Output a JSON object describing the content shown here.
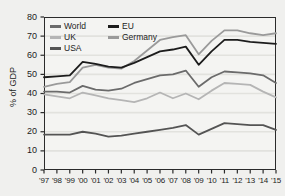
{
  "chart_data": {
    "type": "line",
    "title": "",
    "subtitle": "",
    "xlabel": "",
    "ylabel": "% of GDP",
    "ylim": [
      0,
      80
    ],
    "yticks": [
      0,
      10,
      20,
      30,
      40,
      50,
      60,
      70,
      80
    ],
    "grid": true,
    "grid_axis": "y",
    "legend_position": "top-left-inside",
    "x": [
      1997,
      1998,
      1999,
      2000,
      2001,
      2002,
      2003,
      2004,
      2005,
      2006,
      2007,
      2008,
      2009,
      2010,
      2011,
      2012,
      2013,
      2014,
      2015
    ],
    "categories": [
      "'97",
      "'98",
      "'99",
      "'00",
      "'01",
      "'02",
      "'03",
      "'04",
      "'05",
      "'06",
      "'07",
      "'08",
      "'09",
      "'10",
      "'11",
      "'12",
      "'13",
      "'14",
      "'15"
    ],
    "series": [
      {
        "name": "Germany",
        "color": "#9a9a9a",
        "values": [
          43.5,
          45.0,
          46.0,
          53.5,
          55.0,
          53.5,
          53.0,
          57.0,
          62.5,
          68.0,
          69.5,
          70.5,
          60.5,
          67.5,
          73.0,
          73.0,
          71.5,
          70.5,
          71.5
        ]
      },
      {
        "name": "EU",
        "color": "#1c1c1c",
        "values": [
          48.5,
          49.0,
          49.5,
          56.5,
          55.5,
          54.0,
          53.5,
          56.0,
          59.0,
          62.0,
          63.0,
          64.5,
          55.0,
          62.0,
          68.0,
          68.0,
          67.0,
          66.5,
          66.0
        ]
      },
      {
        "name": "World",
        "color": "#6b6b6b",
        "values": [
          41.0,
          41.0,
          40.5,
          44.0,
          42.0,
          41.5,
          42.5,
          45.5,
          47.5,
          49.5,
          50.0,
          52.0,
          43.5,
          48.5,
          51.5,
          51.0,
          50.5,
          49.5,
          45.5
        ]
      },
      {
        "name": "UK",
        "color": "#b5b5b5",
        "values": [
          39.5,
          38.5,
          37.5,
          40.5,
          39.0,
          37.5,
          36.5,
          35.5,
          37.5,
          40.5,
          37.5,
          40.0,
          37.0,
          41.5,
          45.5,
          45.0,
          44.5,
          41.0,
          38.0
        ]
      },
      {
        "name": "USA",
        "color": "#545454",
        "values": [
          18.5,
          18.5,
          18.5,
          20.0,
          19.0,
          17.5,
          18.0,
          19.0,
          20.0,
          21.0,
          22.0,
          23.5,
          18.5,
          21.5,
          24.5,
          24.0,
          23.5,
          23.5,
          21.0
        ]
      }
    ]
  },
  "legend": {
    "entries": [
      {
        "label": "World",
        "color": "#6b6b6b"
      },
      {
        "label": "EU",
        "color": "#1c1c1c"
      },
      {
        "label": "UK",
        "color": "#b5b5b5"
      },
      {
        "label": "Germany",
        "color": "#9a9a9a"
      },
      {
        "label": "USA",
        "color": "#545454"
      }
    ]
  },
  "axes": {
    "y_label": "% of GDP",
    "y_tick_labels": [
      "80",
      "70",
      "60",
      "50",
      "40",
      "30",
      "20",
      "10",
      "0"
    ],
    "x_tick_labels": [
      "'97",
      "'98",
      "'99",
      "'00",
      "'01",
      "'02",
      "'03",
      "'04",
      "'05",
      "'06",
      "'07",
      "'08",
      "'09",
      "'10",
      "'11",
      "'12",
      "'13",
      "'14",
      "'15"
    ]
  }
}
